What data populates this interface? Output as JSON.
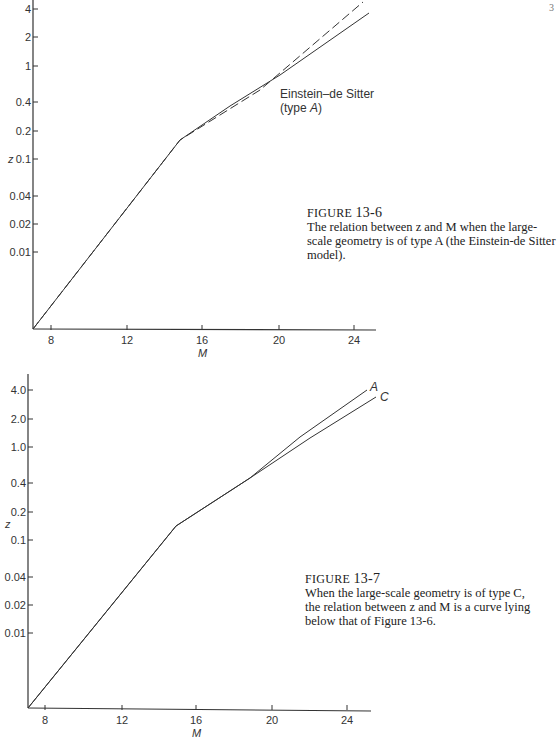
{
  "page_mark": "3",
  "figures": [
    {
      "id": "fig-13-6",
      "caption": {
        "label": "FIGURE",
        "number": "13-6",
        "text": "The relation between z and M when the large-scale geometry is of type A (the Einstein-de Sitter model)."
      },
      "annotation": {
        "line1": "Einstein–de Sitter",
        "line2_pre": "(type ",
        "line2_var": "A",
        "line2_post": ")"
      },
      "axes": {
        "xlabel": "M",
        "ylabel": "z"
      }
    },
    {
      "id": "fig-13-7",
      "caption": {
        "label": "FIGURE",
        "number": "13-7",
        "text": "When the large-scale geometry is of type C, the relation between z and M is a curve lying below that of Figure 13-6."
      },
      "curve_labels": {
        "a": "A",
        "c": "C"
      },
      "axes": {
        "xlabel": "M",
        "ylabel": "z"
      }
    }
  ],
  "chart_data": [
    {
      "type": "line",
      "title": "FIGURE 13-6: z vs M, Einstein-de Sitter (type A)",
      "xlabel": "M",
      "ylabel": "z",
      "yscale": "log",
      "x_ticks": [
        "8",
        "12",
        "16",
        "20",
        "24"
      ],
      "y_ticks": [
        "0.01",
        "0.02",
        "0.04",
        "0.1",
        "0.2",
        "0.4",
        "1",
        "2",
        "4"
      ],
      "xlim": [
        7,
        25
      ],
      "ylim": [
        0.001,
        5
      ],
      "grid": false,
      "series": [
        {
          "name": "linear (Hubble law extrapolation)",
          "style": "dashed",
          "x": [
            7,
            12,
            16,
            20,
            24.5
          ],
          "y": [
            0.001,
            0.012,
            0.075,
            0.45,
            4.5
          ]
        },
        {
          "name": "Einstein-de Sitter (type A)",
          "style": "solid",
          "x": [
            7,
            12,
            16,
            20,
            24.8
          ],
          "y": [
            0.001,
            0.012,
            0.075,
            0.4,
            2.8
          ]
        }
      ],
      "annotations": [
        "Einstein–de Sitter (type A)"
      ]
    },
    {
      "type": "line",
      "title": "FIGURE 13-7: z vs M, type C geometry",
      "xlabel": "M",
      "ylabel": "z",
      "yscale": "log",
      "x_ticks": [
        "8",
        "12",
        "16",
        "20",
        "24"
      ],
      "y_ticks": [
        "0.01",
        "0.02",
        "0.04",
        "0.1",
        "0.2",
        "0.4",
        "1.0",
        "2.0",
        "4.0"
      ],
      "xlim": [
        7,
        25
      ],
      "ylim": [
        0.001,
        5
      ],
      "grid": false,
      "series": [
        {
          "name": "A",
          "style": "solid",
          "x": [
            7,
            12,
            16,
            20,
            24.5
          ],
          "y": [
            0.001,
            0.012,
            0.075,
            0.45,
            4.0
          ]
        },
        {
          "name": "C",
          "style": "solid",
          "x": [
            7,
            12,
            16,
            20,
            25
          ],
          "y": [
            0.001,
            0.012,
            0.075,
            0.4,
            2.6
          ]
        }
      ],
      "annotations": [
        "A",
        "C"
      ]
    }
  ],
  "ticks": {
    "chart1": {
      "x": [
        {
          "label": "8",
          "px": 51
        },
        {
          "label": "12",
          "px": 127
        },
        {
          "label": "16",
          "px": 202
        },
        {
          "label": "20",
          "px": 279
        },
        {
          "label": "24",
          "px": 354
        }
      ],
      "y": [
        {
          "label": "4",
          "py": 9
        },
        {
          "label": "2",
          "py": 37
        },
        {
          "label": "1",
          "py": 66
        },
        {
          "label": "0.4",
          "py": 102
        },
        {
          "label": "0.2",
          "py": 131
        },
        {
          "label": "0.1",
          "py": 159
        },
        {
          "label": "0.04",
          "py": 196
        },
        {
          "label": "0.02",
          "py": 224
        },
        {
          "label": "0.01",
          "py": 252
        }
      ]
    },
    "chart2": {
      "x": [
        {
          "label": "8",
          "px": 45
        },
        {
          "label": "12",
          "px": 122
        },
        {
          "label": "16",
          "px": 196
        },
        {
          "label": "20",
          "px": 272
        },
        {
          "label": "24",
          "px": 347
        }
      ],
      "y": [
        {
          "label": "4.0",
          "py": 390
        },
        {
          "label": "2.0",
          "py": 419
        },
        {
          "label": "1.0",
          "py": 447
        },
        {
          "label": "0.4",
          "py": 483
        },
        {
          "label": "0.2",
          "py": 512
        },
        {
          "label": "0.1",
          "py": 540
        },
        {
          "label": "0.04",
          "py": 577
        },
        {
          "label": "0.02",
          "py": 605
        },
        {
          "label": "0.01",
          "py": 633
        }
      ]
    }
  }
}
